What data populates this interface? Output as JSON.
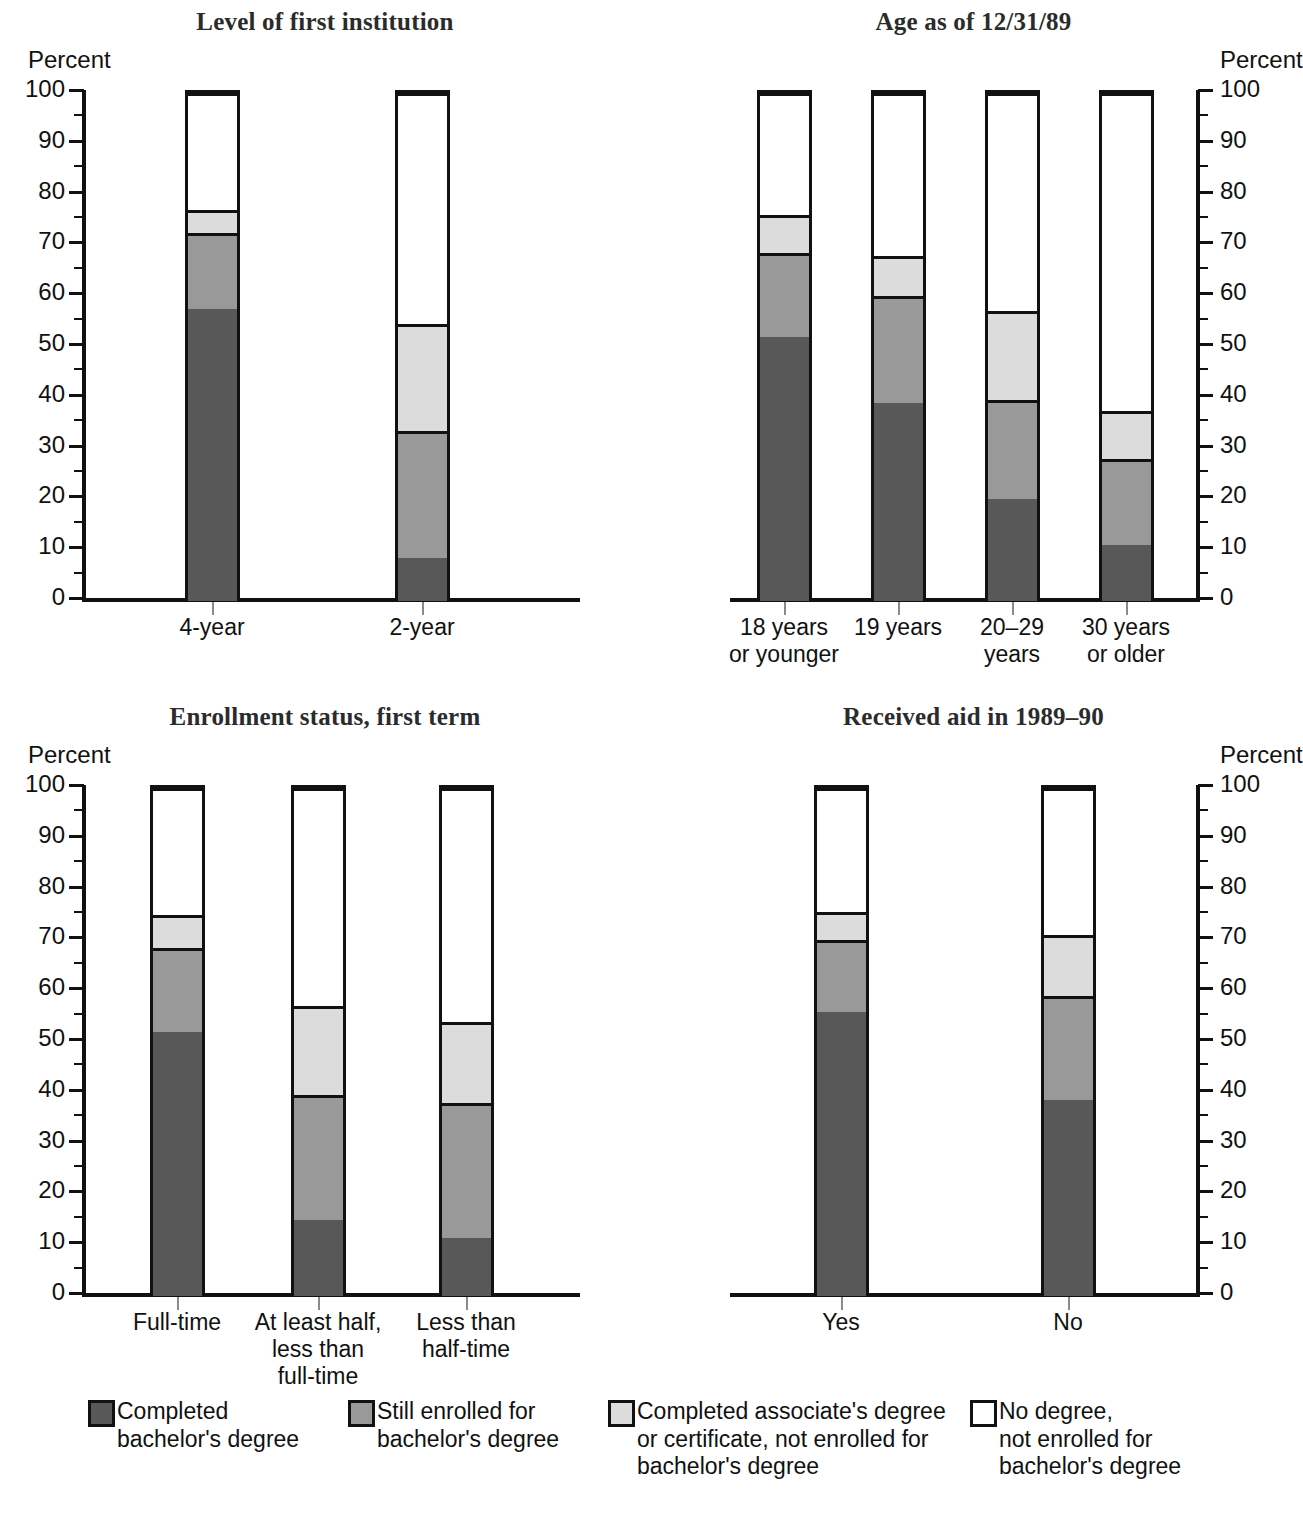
{
  "colors": {
    "completed_bachelors": "#585858",
    "still_enrolled": "#999999",
    "completed_associate": "#dcdcdc",
    "no_degree": "#ffffff",
    "outline": "#111111",
    "title": "#2b2b2b"
  },
  "axis": {
    "percent_label": "Percent",
    "ticks": [
      "100",
      "90",
      "80",
      "70",
      "60",
      "50",
      "40",
      "30",
      "20",
      "10",
      "0"
    ]
  },
  "legend": {
    "items": [
      {
        "label": "Completed\nbachelor's degree",
        "color_key": "completed_bachelors"
      },
      {
        "label": "Still enrolled for\nbachelor's degree",
        "color_key": "still_enrolled"
      },
      {
        "label": "Completed associate's degree\nor certificate, not enrolled for\nbachelor's degree",
        "color_key": "completed_associate"
      },
      {
        "label": "No degree,\nnot enrolled for\nbachelor's degree",
        "color_key": "no_degree"
      }
    ]
  },
  "chart_data": [
    {
      "type": "bar",
      "subtype": "stacked-100",
      "title": "Level of first institution",
      "xlabel": "",
      "ylabel": "Percent",
      "ylim": [
        0,
        100
      ],
      "yticks": [
        0,
        10,
        20,
        30,
        40,
        50,
        60,
        70,
        80,
        90,
        100
      ],
      "minor_tick_step": 5,
      "grid": false,
      "axis_side": "left",
      "legend_position": "bottom-shared",
      "categories": [
        "4-year",
        "2-year"
      ],
      "series": [
        {
          "name": "Completed bachelor's degree",
          "values": [
            57.5,
            8.5
          ]
        },
        {
          "name": "Still enrolled for bachelor's degree",
          "values": [
            15.0,
            25.0
          ]
        },
        {
          "name": "Completed associate's degree or certificate, not enrolled for bachelor's degree",
          "values": [
            4.5,
            21.0
          ]
        },
        {
          "name": "No degree, not enrolled for bachelor's degree",
          "values": [
            23.0,
            45.5
          ]
        }
      ],
      "cumulative_tops": [
        [
          57.5,
          72.5,
          77.0,
          100
        ],
        [
          8.5,
          33.5,
          54.5,
          100
        ]
      ]
    },
    {
      "type": "bar",
      "subtype": "stacked-100",
      "title": "Age as of 12/31/89",
      "xlabel": "",
      "ylabel": "Percent",
      "ylim": [
        0,
        100
      ],
      "yticks": [
        0,
        10,
        20,
        30,
        40,
        50,
        60,
        70,
        80,
        90,
        100
      ],
      "minor_tick_step": 5,
      "grid": false,
      "axis_side": "right",
      "legend_position": "bottom-shared",
      "categories": [
        "18 years\nor younger",
        "19 years",
        "20–29\nyears",
        "30 years\nor older"
      ],
      "series": [
        {
          "name": "Completed bachelor's degree",
          "values": [
            52.0,
            39.0,
            20.0,
            11.0
          ]
        },
        {
          "name": "Still enrolled for bachelor's degree",
          "values": [
            16.5,
            21.0,
            19.5,
            17.0
          ]
        },
        {
          "name": "Completed associate's degree or certificate, not enrolled for bachelor's degree",
          "values": [
            7.5,
            8.0,
            17.5,
            9.5
          ]
        },
        {
          "name": "No degree, not enrolled for bachelor's degree",
          "values": [
            24.0,
            32.0,
            43.0,
            62.5
          ]
        }
      ],
      "cumulative_tops": [
        [
          52.0,
          68.5,
          76.0,
          100
        ],
        [
          39.0,
          60.0,
          68.0,
          100
        ],
        [
          20.0,
          39.5,
          57.0,
          100
        ],
        [
          11.0,
          28.0,
          37.5,
          100
        ]
      ]
    },
    {
      "type": "bar",
      "subtype": "stacked-100",
      "title": "Enrollment status, first term",
      "xlabel": "",
      "ylabel": "Percent",
      "ylim": [
        0,
        100
      ],
      "yticks": [
        0,
        10,
        20,
        30,
        40,
        50,
        60,
        70,
        80,
        90,
        100
      ],
      "minor_tick_step": 5,
      "grid": false,
      "axis_side": "left",
      "legend_position": "bottom-shared",
      "categories": [
        "Full-time",
        "At least half,\nless than\nfull-time",
        "Less than\nhalf-time"
      ],
      "series": [
        {
          "name": "Completed bachelor's degree",
          "values": [
            52.0,
            15.0,
            11.5
          ]
        },
        {
          "name": "Still enrolled for bachelor's degree",
          "values": [
            16.5,
            24.5,
            26.5
          ]
        },
        {
          "name": "Completed associate's degree or certificate, not enrolled for bachelor's degree",
          "values": [
            6.5,
            17.5,
            16.0
          ]
        },
        {
          "name": "No degree, not enrolled for bachelor's degree",
          "values": [
            25.0,
            43.0,
            46.0
          ]
        }
      ],
      "cumulative_tops": [
        [
          52.0,
          68.5,
          75.0,
          100
        ],
        [
          15.0,
          39.5,
          57.0,
          100
        ],
        [
          11.5,
          38.0,
          54.0,
          100
        ]
      ]
    },
    {
      "type": "bar",
      "subtype": "stacked-100",
      "title": "Received aid in 1989–90",
      "xlabel": "",
      "ylabel": "Percent",
      "ylim": [
        0,
        100
      ],
      "yticks": [
        0,
        10,
        20,
        30,
        40,
        50,
        60,
        70,
        80,
        90,
        100
      ],
      "minor_tick_step": 5,
      "grid": false,
      "axis_side": "right",
      "legend_position": "bottom-shared",
      "categories": [
        "Yes",
        "No"
      ],
      "series": [
        {
          "name": "Completed bachelor's degree",
          "values": [
            56.0,
            38.5
          ]
        },
        {
          "name": "Still enrolled for bachelor's degree",
          "values": [
            14.0,
            20.5
          ]
        },
        {
          "name": "Completed associate's degree or certificate, not enrolled for bachelor's degree",
          "values": [
            5.5,
            12.0
          ]
        },
        {
          "name": "No degree, not enrolled for bachelor's degree",
          "values": [
            24.5,
            29.0
          ]
        }
      ],
      "cumulative_tops": [
        [
          56.0,
          70.0,
          75.5,
          100
        ],
        [
          38.5,
          59.0,
          71.0,
          100
        ]
      ]
    }
  ]
}
